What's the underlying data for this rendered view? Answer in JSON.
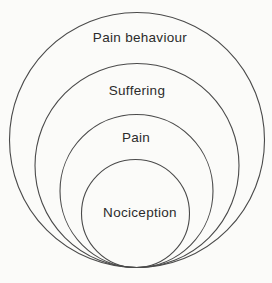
{
  "diagram": {
    "type": "nested-circles",
    "rings": [
      {
        "label": "Pain behaviour"
      },
      {
        "label": "Suffering"
      },
      {
        "label": "Pain"
      },
      {
        "label": "Nociception"
      }
    ],
    "colors": {
      "line": "#4a4a4a",
      "text": "#2b2b2b",
      "background": "#fbfbf9"
    }
  }
}
